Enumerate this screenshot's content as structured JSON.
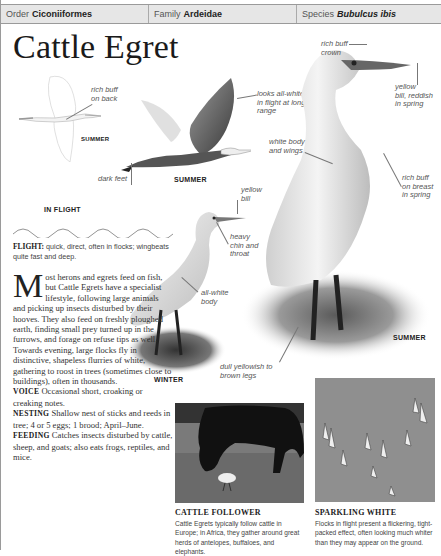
{
  "header": {
    "order_label": "Order",
    "order_value": "Ciconiiformes",
    "family_label": "Family",
    "family_value": "Ardeidae",
    "species_label": "Species",
    "species_value": "Bubulcus ibis"
  },
  "title": "Cattle Egret",
  "illustrations": {
    "in_flight": {
      "season": "SUMMER",
      "caption": "IN FLIGHT",
      "labels": {
        "back": "rich buff\non back"
      }
    },
    "flying": {
      "season": "SUMMER",
      "labels": {
        "range": "looks all-white\nin flight at long\nrange",
        "feet": "dark feet"
      }
    },
    "standing_summer": {
      "season": "SUMMER",
      "labels": {
        "crown": "rich buff\ncrown",
        "bill": "yellow\nbill, reddish\nin spring",
        "body": "white body\nand wings",
        "breast": "rich buff\non breast\nin spring",
        "legs": "dull yellowish to\nbrown legs"
      }
    },
    "standing_winter": {
      "season": "WINTER",
      "labels": {
        "bill": "yellow\nbill",
        "chin": "heavy\nchin and\nthroat",
        "body": "all-white\nbody"
      }
    }
  },
  "flight_note": {
    "label": "FLIGHT:",
    "text": " quick, direct, often in flocks; wingbeats quite fast and deep."
  },
  "body": {
    "dropcap": "M",
    "intro": "ost herons and egrets feed on fish, but Cattle Egrets have a specialist lifestyle, following large animals and picking up insects disturbed by their hooves. They also feed on freshly ploughed earth, finding small prey turned up in the furrows, and forage on refuse tips as well. Towards evening, large flocks fly in distinctive, shapeless flurries of white, gathering to roost in trees (sometimes close to buildings), often in thousands.",
    "voice_label": "VOICE",
    "voice_text": " Occasional short, croaking or creaking notes.",
    "nesting_label": "NESTING",
    "nesting_text": " Shallow nest of sticks and reeds in tree; 4 or 5 eggs; 1 brood; April–June.",
    "feeding_label": "FEEDING",
    "feeding_text": " Catches insects disturbed by cattle, sheep, and goats; also eats frogs, reptiles, and mice."
  },
  "photos": [
    {
      "title": "CATTLE FOLLOWER",
      "text": "Cattle Egrets typically follow cattle in Europe; in Africa, they gather around great herds of antelopes, buffaloes, and elephants."
    },
    {
      "title": "SPARKLING WHITE",
      "text": "Flocks in flight present a flickering, tight-packed effect, often looking much whiter than they may appear on the ground."
    }
  ],
  "colors": {
    "header_bg": "#e6e6e6",
    "rule": "#9a9a9a",
    "sky": "#8f8f8f"
  }
}
